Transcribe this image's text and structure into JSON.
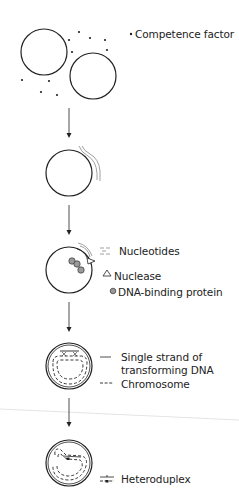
{
  "diagram": {
    "type": "bacterial-transformation-process",
    "steps": [
      {
        "id": 1,
        "description": "Two cells with competence factor"
      },
      {
        "id": 2,
        "description": "Double-stranded DNA binds to cell surface"
      },
      {
        "id": 3,
        "description": "DNA enters; one strand degraded by nuclease; DNA-binding proteins attach"
      },
      {
        "id": 4,
        "description": "Single strand pairs with chromosome"
      },
      {
        "id": 5,
        "description": "Heteroduplex formed"
      }
    ],
    "legend": {
      "competence_factor": "Competence factor",
      "nucleotides": "Nucleotides",
      "nuclease": "Nuclease",
      "dna_binding_protein": "DNA-binding protein",
      "single_strand_line1": "Single strand of",
      "single_strand_line2": "transforming DNA",
      "chromosome": "Chromosome",
      "heteroduplex": "Heteroduplex"
    },
    "colors": {
      "stroke": "#222222",
      "dna_gray": "#888888",
      "protein_fill": "#9a9a9a",
      "divider": "#dddddd"
    }
  }
}
